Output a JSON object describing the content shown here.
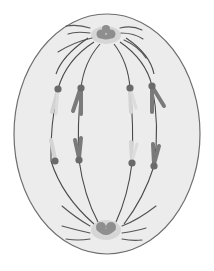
{
  "diagram": {
    "colors": {
      "background": "#ffffff",
      "cytoplasm": "#ececec",
      "membrane": "#6e6e6e",
      "fiber": "#4a4a4a",
      "centromere": "#6a6a6a",
      "chromatid_dark": "#7a7a7a",
      "chromatid_light": "#cfcfcf",
      "centrosome": "#8e8e8e",
      "centrosome_halo": "#cdcdcd"
    },
    "cell": {
      "cx": 107,
      "cy": 133,
      "rx": 93,
      "ry": 120
    },
    "poles": [
      {
        "name": "upper-pole",
        "x": 106,
        "y": 36
      },
      {
        "name": "lower-pole",
        "x": 106,
        "y": 230
      }
    ],
    "centromeres_upper": [
      {
        "x": 58,
        "y": 89
      },
      {
        "x": 81,
        "y": 88
      },
      {
        "x": 130,
        "y": 88
      },
      {
        "x": 152,
        "y": 86
      }
    ],
    "centromeres_lower": [
      {
        "x": 55,
        "y": 161
      },
      {
        "x": 79,
        "y": 160
      },
      {
        "x": 132,
        "y": 163
      },
      {
        "x": 154,
        "y": 166
      }
    ]
  }
}
